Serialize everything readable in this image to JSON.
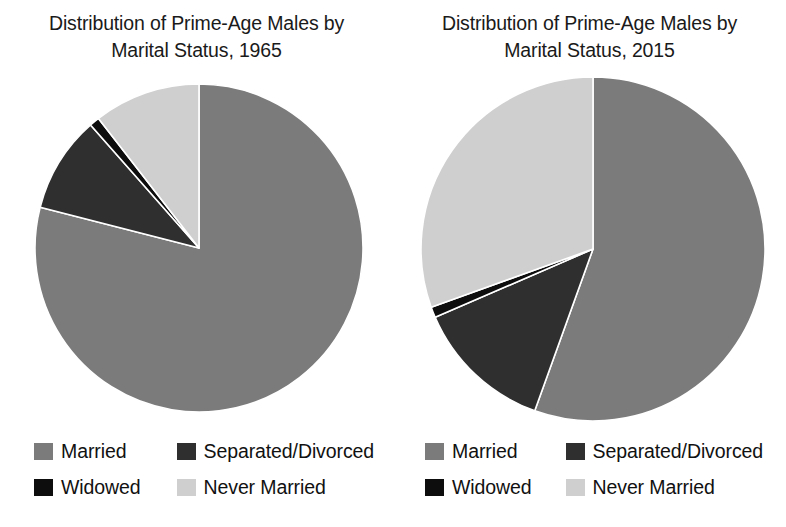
{
  "figure": {
    "background": "#ffffff",
    "panels": [
      {
        "id": "panel-1965",
        "title": "Distribution of Prime-Age Males by\nMarital Status, 1965",
        "legend": [
          {
            "label": "Married",
            "color": "#7b7b7b"
          },
          {
            "label": "Separated/Divorced",
            "color": "#2f2f2f"
          },
          {
            "label": "Widowed",
            "color": "#0d0d0d"
          },
          {
            "label": "Never Married",
            "color": "#cfcfcf"
          }
        ]
      },
      {
        "id": "panel-2015",
        "title": "Distribution of Prime-Age Males by\nMarital Status, 2015",
        "legend": [
          {
            "label": "Married",
            "color": "#7b7b7b"
          },
          {
            "label": "Separated/Divorced",
            "color": "#2f2f2f"
          },
          {
            "label": "Widowed",
            "color": "#0d0d0d"
          },
          {
            "label": "Never Married",
            "color": "#cfcfcf"
          }
        ]
      }
    ]
  },
  "chart_data": [
    {
      "type": "pie",
      "title": "Distribution of Prime-Age Males by Marital Status, 1965",
      "id": "pie-1965",
      "year": 1965,
      "start_angle_deg": 0,
      "direction": "clockwise",
      "center": [
        199,
        248
      ],
      "radius": 164,
      "labels": [
        "Married",
        "Separated/Divorced",
        "Widowed",
        "Never Married"
      ],
      "values": [
        79.0,
        9.5,
        1.0,
        10.5
      ],
      "unit": "percent",
      "colors": [
        "#7b7b7b",
        "#2f2f2f",
        "#0d0d0d",
        "#cfcfcf"
      ],
      "legend_position": "bottom",
      "grid": false,
      "xlabel": "",
      "ylabel": ""
    },
    {
      "type": "pie",
      "title": "Distribution of Prime-Age Males by Marital Status, 2015",
      "id": "pie-2015",
      "year": 2015,
      "start_angle_deg": 0,
      "direction": "clockwise",
      "center": [
        593,
        249
      ],
      "radius": 172,
      "labels": [
        "Married",
        "Separated/Divorced",
        "Widowed",
        "Never Married"
      ],
      "values": [
        55.5,
        13.0,
        1.0,
        30.5
      ],
      "unit": "percent",
      "colors": [
        "#7b7b7b",
        "#2f2f2f",
        "#0d0d0d",
        "#cfcfcf"
      ],
      "legend_position": "bottom",
      "grid": false,
      "xlabel": "",
      "ylabel": ""
    }
  ]
}
